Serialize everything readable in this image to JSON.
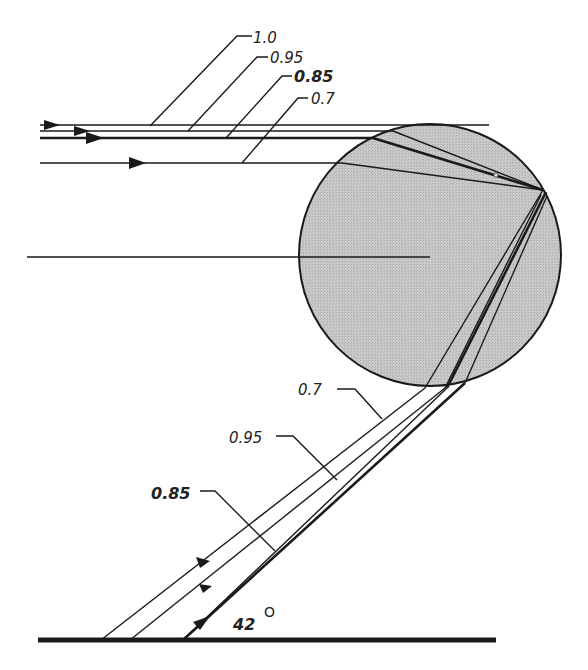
{
  "diagram": {
    "title": "",
    "colors": {
      "drop_fill": "#c4c4c4",
      "ink": "#1a1a1a",
      "background": "#ffffff"
    },
    "incoming_labels": {
      "r1": "1.0",
      "r095": "0.95",
      "r085": "0.85",
      "r07": "0.7"
    },
    "outgoing_labels": {
      "r07": "0.7",
      "r095": "0.95",
      "r085": "0.85"
    },
    "angle": {
      "value": "42",
      "unit_symbol": "O"
    },
    "elements": [
      "raindrop-circle",
      "incoming-ray-1.0",
      "incoming-ray-0.95",
      "incoming-ray-0.85",
      "incoming-ray-0.7",
      "central-axis",
      "outgoing-ray-0.7",
      "outgoing-ray-0.95",
      "outgoing-ray-0.85",
      "ground-line"
    ]
  }
}
